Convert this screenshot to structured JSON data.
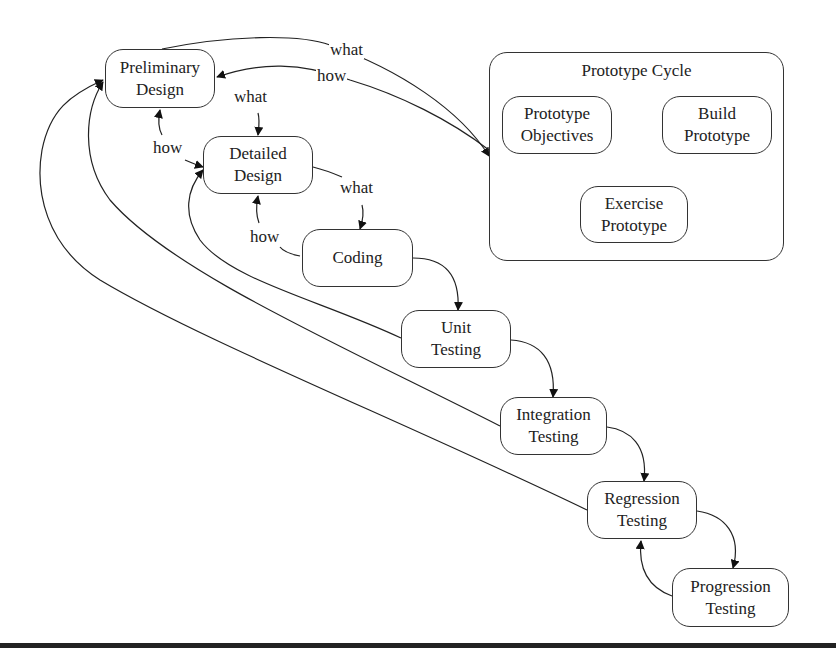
{
  "diagram": {
    "nodes": {
      "preliminary_design": {
        "line1": "Preliminary",
        "line2": "Design"
      },
      "detailed_design": {
        "line1": "Detailed",
        "line2": "Design"
      },
      "coding": {
        "line1": "Coding"
      },
      "unit_testing": {
        "line1": "Unit",
        "line2": "Testing"
      },
      "integration_testing": {
        "line1": "Integration",
        "line2": "Testing"
      },
      "regression_testing": {
        "line1": "Regression",
        "line2": "Testing"
      },
      "progression_testing": {
        "line1": "Progression",
        "line2": "Testing"
      }
    },
    "prototype_cycle": {
      "title": "Prototype Cycle",
      "nodes": {
        "objectives": {
          "line1": "Prototype",
          "line2": "Objectives"
        },
        "build": {
          "line1": "Build",
          "line2": "Prototype"
        },
        "exercise": {
          "line1": "Exercise",
          "line2": "Prototype"
        }
      }
    },
    "edge_labels": {
      "pd_to_proto_what": "what",
      "proto_to_pd_how": "how",
      "pd_to_dd_what": "what",
      "dd_to_pd_how": "how",
      "dd_to_coding_what": "what",
      "coding_to_dd_how": "how"
    },
    "edges": [
      {
        "from": "Preliminary Design",
        "to": "Prototype Cycle",
        "label": "what"
      },
      {
        "from": "Prototype Cycle",
        "to": "Preliminary Design",
        "label": "how"
      },
      {
        "from": "Preliminary Design",
        "to": "Detailed Design",
        "label": "what"
      },
      {
        "from": "Detailed Design",
        "to": "Preliminary Design",
        "label": "how"
      },
      {
        "from": "Detailed Design",
        "to": "Coding",
        "label": "what"
      },
      {
        "from": "Coding",
        "to": "Detailed Design",
        "label": "how"
      },
      {
        "from": "Coding",
        "to": "Unit Testing"
      },
      {
        "from": "Unit Testing",
        "to": "Integration Testing"
      },
      {
        "from": "Integration Testing",
        "to": "Regression Testing"
      },
      {
        "from": "Regression Testing",
        "to": "Progression Testing"
      },
      {
        "from": "Progression Testing",
        "to": "Regression Testing"
      },
      {
        "from": "Unit Testing",
        "to": "Detailed Design"
      },
      {
        "from": "Integration Testing",
        "to": "Preliminary Design"
      },
      {
        "from": "Regression Testing",
        "to": "Preliminary Design"
      },
      {
        "from": "Prototype Objectives",
        "to": "Build Prototype"
      },
      {
        "from": "Build Prototype",
        "to": "Exercise Prototype"
      },
      {
        "from": "Exercise Prototype",
        "to": "Prototype Objectives"
      }
    ]
  }
}
